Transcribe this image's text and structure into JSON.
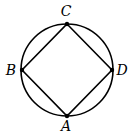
{
  "diagram": {
    "type": "inscribed-square-in-circle",
    "circle": {
      "cx": 67,
      "cy": 70,
      "r": 46
    },
    "points": [
      {
        "label": "C",
        "x": 67,
        "y": 24,
        "lx": 66,
        "ly": 16
      },
      {
        "label": "D",
        "x": 112,
        "y": 70,
        "lx": 122,
        "ly": 75
      },
      {
        "label": "A",
        "x": 67,
        "y": 116,
        "lx": 66,
        "ly": 131
      },
      {
        "label": "B",
        "x": 22,
        "y": 70,
        "lx": 11,
        "ly": 75
      }
    ],
    "stroke_color": "#000000"
  }
}
